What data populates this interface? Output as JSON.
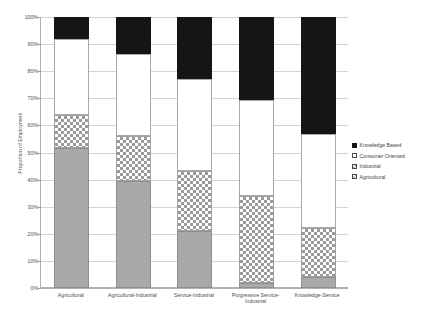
{
  "chart_data": {
    "type": "bar",
    "subtype": "stacked-bar-100pct",
    "title": "",
    "xlabel": "",
    "ylabel": "Proportion of Employment",
    "ylim": [
      0,
      100
    ],
    "ytick_labels": [
      "0%",
      "10%",
      "20%",
      "30%",
      "40%",
      "50%",
      "60%",
      "70%",
      "80%",
      "90%",
      "100%"
    ],
    "ytick_values": [
      0,
      10,
      20,
      30,
      40,
      50,
      60,
      70,
      80,
      90,
      100
    ],
    "grid": true,
    "legend_position": "right",
    "categories": [
      "Agricultural",
      "Agricultural-Industrial",
      "Service-Industrial",
      "Progressive Service-Industrial",
      "Knowledge-Service"
    ],
    "stack_order_bottom_to_top": [
      "Agricultural",
      "Industrial",
      "Consumer Oriented",
      "Knowledge Based"
    ],
    "series": [
      {
        "name": "Agricultural",
        "values": [
          51.5,
          39.5,
          21.0,
          2.0,
          4.0
        ]
      },
      {
        "name": "Industrial",
        "values": [
          12.5,
          16.5,
          22.0,
          32.0,
          18.0
        ]
      },
      {
        "name": "Consumer Oriented",
        "values": [
          28.0,
          30.5,
          34.0,
          35.5,
          35.0
        ]
      },
      {
        "name": "Knowledge Based",
        "values": [
          8.0,
          13.5,
          23.0,
          30.5,
          43.0
        ]
      }
    ],
    "cumulative_tops": {
      "Agricultural": [
        51.5,
        39.5,
        21.0,
        2.0,
        4.0
      ],
      "Industrial": [
        64.0,
        56.0,
        43.0,
        34.0,
        22.0
      ],
      "Consumer Oriented": [
        92.0,
        86.5,
        77.0,
        69.5,
        57.0
      ],
      "Knowledge Based": [
        100.0,
        100.0,
        100.0,
        100.0,
        100.0
      ]
    },
    "legend": [
      {
        "label": "Knowledge Based",
        "swatch": "knowledge",
        "color": "#151515"
      },
      {
        "label": "Consumer Oriented",
        "swatch": "consumer",
        "color": "#ffffff"
      },
      {
        "label": "Industrial",
        "swatch": "industrial",
        "color": "#ffffff"
      },
      {
        "label": "Agricultural",
        "swatch": "agricultural",
        "color": "#a9a9a9"
      }
    ]
  }
}
